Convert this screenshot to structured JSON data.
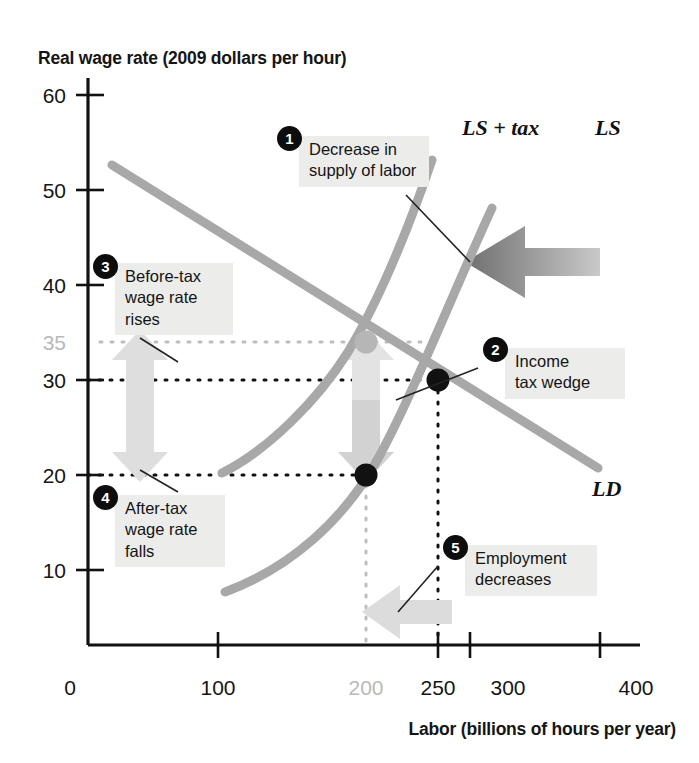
{
  "chart_data": {
    "type": "line",
    "title": "",
    "ylabel": "Real wage rate (2009 dollars per hour)",
    "xlabel": "Labor (billions of hours per year)",
    "xlim": [
      0,
      400
    ],
    "ylim": [
      0,
      65
    ],
    "grid": false,
    "legend_position": "inline-curve-labels",
    "x_ticks": [
      {
        "value": 0,
        "label": "0",
        "muted": false,
        "has_mark": false
      },
      {
        "value": 100,
        "label": "100",
        "muted": false,
        "has_mark": true
      },
      {
        "value": 200,
        "label": "200",
        "muted": true,
        "has_mark": false
      },
      {
        "value": 250,
        "label": "250",
        "muted": false,
        "has_mark": true
      },
      {
        "value": 300,
        "label": "300",
        "muted": false,
        "has_mark": true
      },
      {
        "value": 400,
        "label": "400",
        "muted": false,
        "has_mark": true
      }
    ],
    "y_ticks": [
      {
        "value": 60,
        "label": "60",
        "muted": false,
        "has_mark": true
      },
      {
        "value": 50,
        "label": "50",
        "muted": false,
        "has_mark": true
      },
      {
        "value": 40,
        "label": "40",
        "muted": false,
        "has_mark": true
      },
      {
        "value": 35,
        "label": "35",
        "muted": true,
        "has_mark": false
      },
      {
        "value": 30,
        "label": "30",
        "muted": false,
        "has_mark": true
      },
      {
        "value": 20,
        "label": "20",
        "muted": false,
        "has_mark": true
      },
      {
        "value": 10,
        "label": "10",
        "muted": false,
        "has_mark": true
      }
    ],
    "series": [
      {
        "name": "LD",
        "label": "LD",
        "type": "line",
        "color": "#a8a8a8",
        "shape": "straight",
        "points": [
          [
            18,
            52.5
          ],
          [
            400,
            17.5
          ]
        ]
      },
      {
        "name": "LS",
        "label": "LS",
        "type": "line",
        "color": "#a8a8a8",
        "shape": "convex-curve",
        "points": [
          [
            105,
            10
          ],
          [
            200,
            20
          ],
          [
            250,
            30
          ],
          [
            320,
            48
          ],
          [
            360,
            58
          ]
        ]
      },
      {
        "name": "LS + tax",
        "label": "LS + tax",
        "type": "line",
        "color": "#a8a8a8",
        "shape": "convex-curve",
        "points": [
          [
            100,
            20
          ],
          [
            160,
            27
          ],
          [
            200,
            35
          ],
          [
            255,
            50
          ],
          [
            290,
            60
          ]
        ]
      }
    ],
    "points_marked": [
      {
        "name": "before-tax-equilibrium",
        "x": 200,
        "y": 35,
        "color": "#b6b6b6",
        "filled": true
      },
      {
        "name": "no-tax-equilibrium",
        "x": 250,
        "y": 30,
        "color": "#111111",
        "filled": true
      },
      {
        "name": "after-tax-equilibrium",
        "x": 200,
        "y": 20,
        "color": "#111111",
        "filled": true
      }
    ],
    "annotations": [
      {
        "id": 1,
        "text": "Decrease in\nsupply of labor",
        "arrow": "left-shift-of-labor-supply"
      },
      {
        "id": 2,
        "text": "Income\ntax wedge",
        "arrow": "wedge-between-35-and-20"
      },
      {
        "id": 3,
        "text": "Before-tax\nwage rate\nrises",
        "arrow": "up-arrow-30-to-35"
      },
      {
        "id": 4,
        "text": "After-tax\nwage rate\nfalls",
        "arrow": "down-arrow-30-to-20"
      },
      {
        "id": 5,
        "text": "Employment\ndecreases",
        "arrow": "left-arrow-250-to-200"
      }
    ],
    "reference_lines": [
      {
        "name": "w-35-dotted",
        "value": 35,
        "orientation": "horizontal",
        "style": "dotted",
        "color": "#b9b9b9"
      },
      {
        "name": "w-30-dotted",
        "value": 30,
        "orientation": "horizontal",
        "style": "dotted",
        "color": "#111111"
      },
      {
        "name": "w-20-dotted",
        "value": 20,
        "orientation": "horizontal",
        "style": "dotted",
        "color": "#111111"
      },
      {
        "name": "l-200-dotted",
        "value": 200,
        "orientation": "vertical",
        "style": "dotted",
        "color": "#b9b9b9"
      },
      {
        "name": "l-250-dotted",
        "value": 250,
        "orientation": "vertical",
        "style": "dotted",
        "color": "#111111"
      }
    ]
  },
  "labels": {
    "y_axis_title": "Real wage rate (2009 dollars per hour)",
    "x_axis_title": "Labor (billions of hours per year)",
    "ls_tax": "LS + tax",
    "ls": "LS",
    "ld": "LD",
    "y_60": "60",
    "y_50": "50",
    "y_40": "40",
    "y_35": "35",
    "y_30": "30",
    "y_20": "20",
    "y_10": "10",
    "x_0": "0",
    "x_100": "100",
    "x_200": "200",
    "x_250": "250",
    "x_300": "300",
    "x_400": "400"
  },
  "callouts": {
    "one": {
      "badge": "1",
      "text": "Decrease in\nsupply of labor"
    },
    "two": {
      "badge": "2",
      "text": "Income\ntax wedge"
    },
    "three": {
      "badge": "3",
      "text": "Before-tax\nwage rate\nrises"
    },
    "four": {
      "badge": "4",
      "text": "After-tax\nwage rate\nfalls"
    },
    "five": {
      "badge": "5",
      "text": "Employment\ndecreases"
    }
  },
  "colors": {
    "curve": "#a8a8a8",
    "axis": "#111111",
    "muted_text": "#b9b9b9",
    "callout_bg": "#ececeb",
    "badge_bg": "#0d0d0d",
    "shift_arrow": "#8e8e8e",
    "pale_arrow": "#dcdcdc"
  }
}
